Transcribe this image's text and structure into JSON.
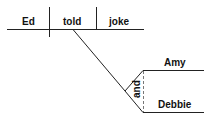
{
  "diagram": {
    "type": "sentence-diagram",
    "subject": "Ed",
    "verb": "told",
    "direct_object": "joke",
    "indirect_object_conjunction": "and",
    "indirect_objects": [
      "Amy",
      "Debbie"
    ]
  }
}
